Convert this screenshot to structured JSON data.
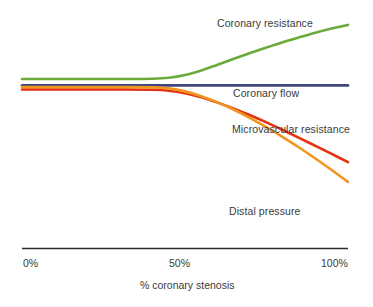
{
  "chart_data": {
    "type": "line",
    "title": "",
    "xlabel": "% coronary stenosis",
    "ylabel": "",
    "xtick_labels": [
      "0%",
      "50%",
      "100%"
    ],
    "xtick_values": [
      0,
      50,
      100
    ],
    "xlim": [
      0,
      100
    ],
    "ylim": [
      0,
      1
    ],
    "grid": false,
    "legend_position": "inline-annotations",
    "series": [
      {
        "name": "Coronary resistance",
        "color": "#6aab3c",
        "x": [
          0,
          10,
          20,
          30,
          40,
          45,
          50,
          55,
          60,
          65,
          70,
          75,
          80,
          85,
          90,
          95,
          100
        ],
        "y": [
          0.735,
          0.735,
          0.735,
          0.735,
          0.736,
          0.74,
          0.752,
          0.772,
          0.797,
          0.823,
          0.848,
          0.872,
          0.895,
          0.916,
          0.936,
          0.954,
          0.97
        ]
      },
      {
        "name": "Coronary flow",
        "color": "#3f487c",
        "x": [
          0,
          10,
          20,
          30,
          40,
          50,
          60,
          70,
          80,
          90,
          100
        ],
        "y": [
          0.707,
          0.707,
          0.707,
          0.707,
          0.707,
          0.707,
          0.707,
          0.707,
          0.707,
          0.707,
          0.707
        ]
      },
      {
        "name": "Microvascular resistance",
        "color": "#e5320e",
        "x": [
          0,
          10,
          20,
          30,
          40,
          45,
          50,
          55,
          60,
          65,
          70,
          75,
          80,
          85,
          90,
          95,
          100
        ],
        "y": [
          0.689,
          0.689,
          0.689,
          0.689,
          0.688,
          0.684,
          0.673,
          0.655,
          0.632,
          0.606,
          0.577,
          0.546,
          0.513,
          0.479,
          0.444,
          0.409,
          0.373
        ]
      },
      {
        "name": "Distal pressure",
        "color": "#f0951f",
        "x": [
          0,
          10,
          20,
          30,
          40,
          45,
          50,
          55,
          60,
          65,
          70,
          75,
          80,
          85,
          90,
          95,
          100
        ],
        "y": [
          0.7,
          0.7,
          0.7,
          0.7,
          0.699,
          0.694,
          0.681,
          0.66,
          0.633,
          0.601,
          0.565,
          0.525,
          0.482,
          0.437,
          0.389,
          0.339,
          0.287
        ]
      }
    ],
    "annotations": [
      {
        "text": "Coronary resistance",
        "series": "Coronary resistance"
      },
      {
        "text": "Coronary flow",
        "series": "Coronary flow"
      },
      {
        "text": "Microvascular resistance",
        "series": "Microvascular resistance"
      },
      {
        "text": "Distal pressure",
        "series": "Distal pressure"
      }
    ],
    "axis": {
      "line_color": "#2b2b2b"
    },
    "text_color": "#3a3a3a",
    "background": "#ffffff"
  },
  "labels": {
    "coronary_resistance": "Coronary resistance",
    "coronary_flow": "Coronary flow",
    "microvascular_resistance": "Microvascular resistance",
    "distal_pressure": "Distal pressure"
  },
  "axis": {
    "ticks": [
      "0%",
      "50%",
      "100%"
    ],
    "title": "% coronary stenosis"
  }
}
